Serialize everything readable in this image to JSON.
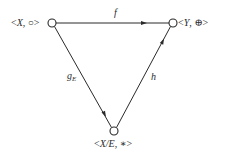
{
  "diagram": {
    "type": "commutative-triangle",
    "nodes": [
      {
        "id": "XO",
        "label_open": "<",
        "label_var": "X",
        "label_rest": ", ○>",
        "x": 52,
        "y": 23
      },
      {
        "id": "YP",
        "label_open": "<",
        "label_var": "Y",
        "label_rest": ", ⊕>",
        "x": 173,
        "y": 23
      },
      {
        "id": "XE",
        "label_open": "<",
        "label_var": "X/E",
        "label_rest": ", ∗>",
        "x": 114,
        "y": 131
      }
    ],
    "edges": [
      {
        "id": "f",
        "from": "XO",
        "to": "YP",
        "label": "f"
      },
      {
        "id": "gE",
        "from": "XO",
        "to": "XE",
        "label_main": "g",
        "label_sub": "E"
      },
      {
        "id": "h",
        "from": "XE",
        "to": "YP",
        "label": "h"
      }
    ],
    "colors": {
      "stroke": "#2a2a2a",
      "background": "#ffffff"
    }
  }
}
